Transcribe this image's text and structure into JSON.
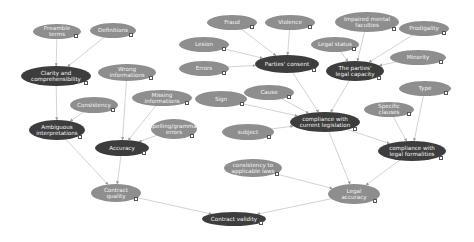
{
  "diagram": {
    "colors": {
      "light_node": "#8e8e8e",
      "dark_node": "#3d3d3d",
      "edge": "#c8c8c8",
      "text": "#f4f4f4"
    },
    "nodes": [
      {
        "id": "preamble",
        "label": "Preamble terms",
        "x": 57,
        "y": 31,
        "w": 48,
        "h": 15,
        "tone": "light"
      },
      {
        "id": "definitions",
        "label": "Definitions",
        "x": 113,
        "y": 30,
        "w": 46,
        "h": 15,
        "tone": "light"
      },
      {
        "id": "clarity",
        "label": "Clarity and comprehensibility",
        "x": 56,
        "y": 76,
        "w": 70,
        "h": 20,
        "tone": "dark"
      },
      {
        "id": "wrong_info",
        "label": "Wrong informations",
        "x": 127,
        "y": 72,
        "w": 58,
        "h": 17,
        "tone": "light"
      },
      {
        "id": "consistency",
        "label": "Consistency",
        "x": 94,
        "y": 105,
        "w": 48,
        "h": 16,
        "tone": "light"
      },
      {
        "id": "missing_info",
        "label": "Missing informations",
        "x": 162,
        "y": 98,
        "w": 60,
        "h": 16,
        "tone": "light"
      },
      {
        "id": "ambiguous",
        "label": "Ambiguous interpretations",
        "x": 57,
        "y": 130,
        "w": 56,
        "h": 20,
        "tone": "dark"
      },
      {
        "id": "accuracy",
        "label": "Accuracy",
        "x": 122,
        "y": 148,
        "w": 54,
        "h": 16,
        "tone": "dark"
      },
      {
        "id": "spelling",
        "label": "Spelling/grammar errors",
        "x": 174,
        "y": 129,
        "w": 46,
        "h": 20,
        "tone": "light"
      },
      {
        "id": "fraud",
        "label": "Fraud",
        "x": 232,
        "y": 22,
        "w": 50,
        "h": 15,
        "tone": "light"
      },
      {
        "id": "violence",
        "label": "Violence",
        "x": 290,
        "y": 22,
        "w": 50,
        "h": 15,
        "tone": "light"
      },
      {
        "id": "lesion",
        "label": "Lesion",
        "x": 204,
        "y": 44,
        "w": 50,
        "h": 15,
        "tone": "light"
      },
      {
        "id": "error",
        "label": "Errors",
        "x": 204,
        "y": 68,
        "w": 50,
        "h": 15,
        "tone": "light"
      },
      {
        "id": "parties_consent",
        "label": "Parties' consent",
        "x": 287,
        "y": 64,
        "w": 64,
        "h": 18,
        "tone": "dark"
      },
      {
        "id": "impaired",
        "label": "Impaired mental faculties",
        "x": 367,
        "y": 22,
        "w": 64,
        "h": 20,
        "tone": "light"
      },
      {
        "id": "prodigality",
        "label": "Prodigality",
        "x": 424,
        "y": 28,
        "w": 50,
        "h": 15,
        "tone": "light"
      },
      {
        "id": "legal_status",
        "label": "Legal status",
        "x": 335,
        "y": 44,
        "w": 48,
        "h": 15,
        "tone": "light"
      },
      {
        "id": "minority",
        "label": "Minority",
        "x": 418,
        "y": 57,
        "w": 56,
        "h": 15,
        "tone": "light"
      },
      {
        "id": "legal_capacity",
        "label": "The parties' legal capacity",
        "x": 355,
        "y": 71,
        "w": 58,
        "h": 20,
        "tone": "dark"
      },
      {
        "id": "sign",
        "label": "Sign",
        "x": 221,
        "y": 99,
        "w": 52,
        "h": 16,
        "tone": "light"
      },
      {
        "id": "cause",
        "label": "Cause",
        "x": 269,
        "y": 92,
        "w": 50,
        "h": 15,
        "tone": "light"
      },
      {
        "id": "subject",
        "label": "subject",
        "x": 248,
        "y": 132,
        "w": 52,
        "h": 16,
        "tone": "light"
      },
      {
        "id": "compliance_current",
        "label": "compliance with current legislation",
        "x": 325,
        "y": 122,
        "w": 70,
        "h": 20,
        "tone": "dark"
      },
      {
        "id": "type",
        "label": "Type",
        "x": 425,
        "y": 88,
        "w": 52,
        "h": 15,
        "tone": "light"
      },
      {
        "id": "specific_clauses",
        "label": "Specific clauses",
        "x": 389,
        "y": 109,
        "w": 50,
        "h": 15,
        "tone": "light"
      },
      {
        "id": "compliance_formalities",
        "label": "compliance with legal formalities",
        "x": 412,
        "y": 151,
        "w": 68,
        "h": 20,
        "tone": "dark"
      },
      {
        "id": "consistency_laws",
        "label": "consistency to applicable laws",
        "x": 253,
        "y": 168,
        "w": 58,
        "h": 18,
        "tone": "light"
      },
      {
        "id": "legal_accuracy",
        "label": "Legal accuracy",
        "x": 354,
        "y": 194,
        "w": 52,
        "h": 20,
        "tone": "light"
      },
      {
        "id": "contract_quality",
        "label": "Contract quality",
        "x": 116,
        "y": 193,
        "w": 50,
        "h": 18,
        "tone": "light"
      },
      {
        "id": "contract_validity",
        "label": "Contract validity",
        "x": 234,
        "y": 219,
        "w": 64,
        "h": 14,
        "tone": "dark"
      }
    ],
    "edges": [
      [
        "preamble",
        "clarity"
      ],
      [
        "definitions",
        "clarity"
      ],
      [
        "clarity",
        "ambiguous"
      ],
      [
        "consistency",
        "ambiguous"
      ],
      [
        "wrong_info",
        "accuracy"
      ],
      [
        "missing_info",
        "accuracy"
      ],
      [
        "spelling",
        "accuracy"
      ],
      [
        "ambiguous",
        "contract_quality"
      ],
      [
        "accuracy",
        "contract_quality"
      ],
      [
        "fraud",
        "parties_consent"
      ],
      [
        "violence",
        "parties_consent"
      ],
      [
        "lesion",
        "parties_consent"
      ],
      [
        "error",
        "parties_consent"
      ],
      [
        "impaired",
        "legal_capacity"
      ],
      [
        "prodigality",
        "legal_capacity"
      ],
      [
        "legal_status",
        "legal_capacity"
      ],
      [
        "minority",
        "legal_capacity"
      ],
      [
        "parties_consent",
        "compliance_current"
      ],
      [
        "legal_capacity",
        "compliance_current"
      ],
      [
        "sign",
        "compliance_current"
      ],
      [
        "cause",
        "compliance_current"
      ],
      [
        "subject",
        "compliance_current"
      ],
      [
        "type",
        "compliance_formalities"
      ],
      [
        "specific_clauses",
        "compliance_formalities"
      ],
      [
        "compliance_current",
        "compliance_formalities"
      ],
      [
        "compliance_current",
        "legal_accuracy"
      ],
      [
        "compliance_formalities",
        "legal_accuracy"
      ],
      [
        "consistency_laws",
        "legal_accuracy"
      ],
      [
        "contract_quality",
        "contract_validity"
      ],
      [
        "legal_accuracy",
        "contract_validity"
      ]
    ]
  }
}
